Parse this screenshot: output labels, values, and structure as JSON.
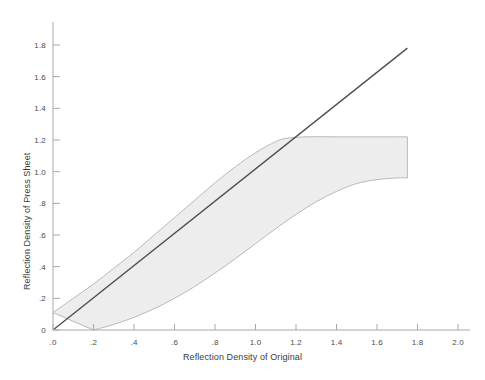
{
  "chart_data": {
    "type": "area",
    "title": "",
    "xlabel": "Reflection Density of Original",
    "ylabel": "Reflection Density of Press Sheet",
    "xlim": [
      0.0,
      2.0
    ],
    "ylim": [
      0.0,
      1.9
    ],
    "grid": false,
    "legend": "none",
    "xticks": [
      0.0,
      0.2,
      0.4,
      0.6,
      0.8,
      1.0,
      1.2,
      1.4,
      1.6,
      1.8,
      2.0
    ],
    "xtick_labels": [
      ".0",
      ".2",
      ".4",
      ".6",
      ".8",
      "1.0",
      "1.2",
      "1.4",
      "1.6",
      "1.8",
      "2.0"
    ],
    "yticks": [
      0.0,
      0.2,
      0.4,
      0.6,
      0.8,
      1.0,
      1.2,
      1.4,
      1.6,
      1.8
    ],
    "ytick_labels": [
      "0",
      ".2",
      ".4",
      ".6",
      ".8",
      "1.0",
      "1.2",
      "1.4",
      "1.6",
      "1.8"
    ],
    "series": [
      {
        "name": "Upper bound of press reproduction band",
        "type": "line",
        "color": "#b9b9b9",
        "x": [
          0.0,
          0.1,
          0.2,
          0.3,
          0.4,
          0.5,
          0.6,
          0.7,
          0.8,
          0.9,
          1.0,
          1.1,
          1.15,
          1.25,
          1.4,
          1.6,
          1.75
        ],
        "y": [
          0.11,
          0.2,
          0.29,
          0.39,
          0.49,
          0.6,
          0.71,
          0.82,
          0.93,
          1.03,
          1.12,
          1.19,
          1.21,
          1.22,
          1.22,
          1.22,
          1.22
        ]
      },
      {
        "name": "Lower bound of press reproduction band",
        "type": "line",
        "color": "#b9b9b9",
        "x": [
          0.2,
          0.3,
          0.4,
          0.5,
          0.6,
          0.7,
          0.8,
          0.9,
          1.0,
          1.1,
          1.2,
          1.3,
          1.4,
          1.5,
          1.6,
          1.7,
          1.75
        ],
        "y": [
          0.0,
          0.035,
          0.08,
          0.135,
          0.2,
          0.275,
          0.36,
          0.45,
          0.545,
          0.64,
          0.73,
          0.81,
          0.875,
          0.925,
          0.95,
          0.96,
          0.96
        ]
      },
      {
        "name": "Ideal 1:1 reproduction reference line",
        "type": "line",
        "color": "#4f4f4f",
        "x": [
          0.0,
          1.75
        ],
        "y": [
          0.0,
          1.78
        ]
      }
    ],
    "band": {
      "name": "Achievable press reproduction range",
      "fill_color": "#ededed",
      "edge_color": "#b9b9b9",
      "x_start": 0.0,
      "x_end": 1.75,
      "top_plateau_value": 1.22,
      "bottom_plateau_value": 0.96
    },
    "annotations": []
  },
  "axes": {
    "x_title": "Reflection Density of Original",
    "y_title": "Reflection Density of Press Sheet"
  },
  "colors": {
    "background": "#ffffff",
    "axis": "#a9a9a9",
    "band_fill": "#ededed",
    "band_edge": "#b9b9b9",
    "reference_line": "#4f4f4f",
    "tick_text": "#4a4a4a",
    "title_text": "#3b3b3b"
  }
}
